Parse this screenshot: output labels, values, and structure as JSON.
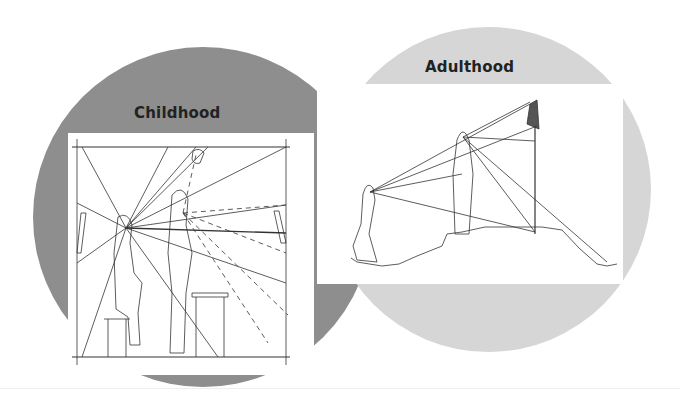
{
  "panels": {
    "childhood": {
      "title": "Childhood",
      "circle_color": "#8e8e8e",
      "illustration": "child-perspective-room-sightlines"
    },
    "adulthood": {
      "title": "Adulthood",
      "circle_color": "#d6d6d6",
      "illustration": "adult-perspective-landscape-sightlines"
    }
  }
}
